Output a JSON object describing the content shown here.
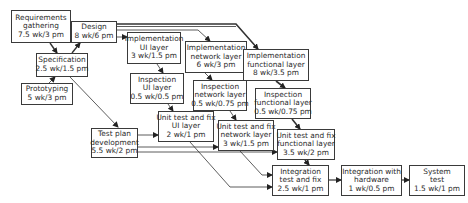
{
  "diagram": {
    "type": "activity-network",
    "nodes": [
      {
        "id": "req",
        "lines": [
          "Requirements",
          "gathering",
          "7.5 wk/3 pm"
        ],
        "x": 11,
        "y": 10,
        "w": 60,
        "h": 33
      },
      {
        "id": "design",
        "lines": [
          "Design",
          "8 wk/6 pm"
        ],
        "x": 71,
        "y": 21,
        "w": 46,
        "h": 22
      },
      {
        "id": "spec",
        "lines": [
          "Specification",
          "2.5 wk/1.5 pm"
        ],
        "x": 36,
        "y": 53,
        "w": 52,
        "h": 24
      },
      {
        "id": "proto",
        "lines": [
          "Prototyping",
          "5 wk/3 pm"
        ],
        "x": 21,
        "y": 83,
        "w": 52,
        "h": 22
      },
      {
        "id": "impl_ui",
        "lines": [
          "Implementation",
          "UI layer",
          "3 wk/1.5 pm"
        ],
        "x": 127,
        "y": 32,
        "w": 54,
        "h": 32
      },
      {
        "id": "impl_net",
        "lines": [
          "Implementation",
          "network layer",
          "6 wk/3 pm"
        ],
        "x": 185,
        "y": 41,
        "w": 62,
        "h": 32
      },
      {
        "id": "impl_func",
        "lines": [
          "Implementation",
          "functional layer",
          "8 wk/3.5 pm"
        ],
        "x": 243,
        "y": 49,
        "w": 66,
        "h": 32
      },
      {
        "id": "insp_ui",
        "lines": [
          "Inspection",
          "UI layer",
          "0.5 wk/0.5 pm"
        ],
        "x": 130,
        "y": 73,
        "w": 54,
        "h": 31
      },
      {
        "id": "insp_net",
        "lines": [
          "Inspection",
          "network layer",
          "0.5 wk/0.75 pm"
        ],
        "x": 193,
        "y": 80,
        "w": 54,
        "h": 31
      },
      {
        "id": "insp_func",
        "lines": [
          "Inspection",
          "functional layer",
          "0.5 wk/0.75 pm"
        ],
        "x": 255,
        "y": 88,
        "w": 56,
        "h": 31
      },
      {
        "id": "ut_ui",
        "lines": [
          "Unit test and fix",
          "UI layer",
          "2 wk/1 pm"
        ],
        "x": 158,
        "y": 111,
        "w": 56,
        "h": 31
      },
      {
        "id": "testplan",
        "lines": [
          "Test plan",
          "development",
          "5.5 wk/2 pm"
        ],
        "x": 91,
        "y": 128,
        "w": 47,
        "h": 30
      },
      {
        "id": "ut_net",
        "lines": [
          "Unit test and fix",
          "network layer",
          "3 wk/1.5 pm"
        ],
        "x": 218,
        "y": 120,
        "w": 56,
        "h": 31
      },
      {
        "id": "ut_func",
        "lines": [
          "Unit test and fix",
          "functional layer",
          "3.5 wk/2 pm"
        ],
        "x": 277,
        "y": 129,
        "w": 58,
        "h": 31
      },
      {
        "id": "integ",
        "lines": [
          "Integration",
          "test and fix",
          "2.5 wk/1 pm"
        ],
        "x": 272,
        "y": 165,
        "w": 57,
        "h": 31
      },
      {
        "id": "integ_hw",
        "lines": [
          "Integration with",
          "hardware",
          "1 wk/0.5 pm"
        ],
        "x": 341,
        "y": 165,
        "w": 61,
        "h": 31
      },
      {
        "id": "systest",
        "lines": [
          "System",
          "test",
          "1.5 wk/1 pm"
        ],
        "x": 409,
        "y": 165,
        "w": 56,
        "h": 31
      }
    ],
    "edges": [
      {
        "from": "req",
        "to": "spec"
      },
      {
        "from": "spec",
        "to": "design"
      },
      {
        "from": "proto",
        "to": "spec"
      },
      {
        "from": "spec",
        "to": "testplan"
      },
      {
        "from": "design",
        "to": "impl_ui"
      },
      {
        "from": "design",
        "to": "impl_net"
      },
      {
        "from": "design",
        "to": "impl_func"
      },
      {
        "from": "impl_ui",
        "to": "insp_ui"
      },
      {
        "from": "impl_net",
        "to": "insp_net"
      },
      {
        "from": "impl_func",
        "to": "insp_func"
      },
      {
        "from": "insp_ui",
        "to": "ut_ui"
      },
      {
        "from": "insp_net",
        "to": "ut_net"
      },
      {
        "from": "insp_func",
        "to": "ut_func"
      },
      {
        "from": "testplan",
        "to": "ut_ui"
      },
      {
        "from": "testplan",
        "to": "ut_net"
      },
      {
        "from": "testplan",
        "to": "ut_func"
      },
      {
        "from": "ut_ui",
        "to": "integ"
      },
      {
        "from": "ut_net",
        "to": "integ"
      },
      {
        "from": "ut_func",
        "to": "integ"
      },
      {
        "from": "integ",
        "to": "integ_hw"
      },
      {
        "from": "integ_hw",
        "to": "systest"
      }
    ],
    "colors": {
      "line": "#333333",
      "border": "#3a3a3a",
      "text": "#2b2b2b",
      "background": "#ffffff"
    }
  }
}
